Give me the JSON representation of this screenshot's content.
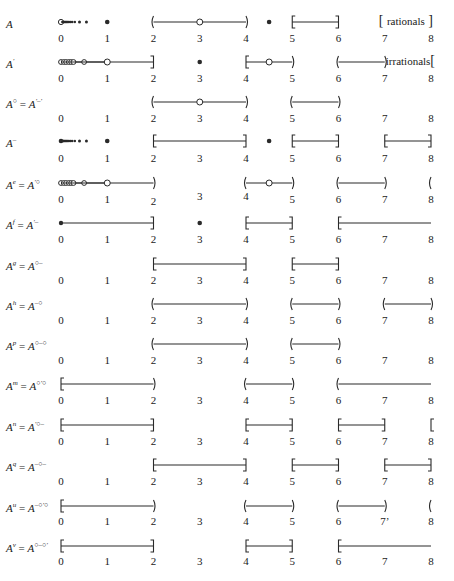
{
  "diagram": {
    "axis": {
      "min": 0,
      "max": 8,
      "x0_px": 61,
      "unit_px": 46.25,
      "ticks": [
        "0",
        "1",
        "2",
        "3",
        "4",
        "5",
        "6",
        "7",
        "8"
      ]
    },
    "rows": [
      {
        "label_base": "A",
        "label_sup": "",
        "label_rhs_base": "",
        "label_rhs_sup": "",
        "y": 22,
        "tick_y": 38,
        "tick_offsets": [
          0,
          0,
          0,
          0,
          0,
          0,
          0,
          0,
          0
        ],
        "items": [
          {
            "type": "seq_open_then_solid",
            "from": 0,
            "to": 0.9
          },
          {
            "type": "dot_solid",
            "at": 1
          },
          {
            "type": "interval",
            "from": 2,
            "to": 4,
            "left": "(",
            "right": ")"
          },
          {
            "type": "dot_open",
            "at": 3
          },
          {
            "type": "dot_solid",
            "at": 4.5
          },
          {
            "type": "interval",
            "from": 5,
            "to": 6,
            "left": "[",
            "right": "]"
          }
        ],
        "annotation": {
          "text": "rationals",
          "left_bracket": "[",
          "right_bracket": "]",
          "from": 7,
          "to": 8
        }
      },
      {
        "label_base": "A",
        "label_sup": "′",
        "label_rhs_base": "",
        "label_rhs_sup": "",
        "y": 62,
        "tick_y": 78,
        "items": [
          {
            "type": "seq_open_line",
            "from": 0,
            "to": 1
          },
          {
            "type": "interval",
            "from": 0,
            "to": 2,
            "left": "none",
            "right": "]"
          },
          {
            "type": "dot_open",
            "at": 1
          },
          {
            "type": "dot_solid",
            "at": 3
          },
          {
            "type": "interval",
            "from": 4,
            "to": 5,
            "left": "[",
            "right": ")"
          },
          {
            "type": "dot_open",
            "at": 4.5
          },
          {
            "type": "interval",
            "from": 6,
            "to": 7,
            "left": "(",
            "right": ")"
          }
        ],
        "annotation": {
          "text": "irrationals",
          "left_bracket": "",
          "right_bracket": "[",
          "from": 7,
          "to": 8
        }
      },
      {
        "label_base": "A",
        "label_sup": "○",
        "label_rhs_base": "A",
        "label_rhs_sup": "′–′",
        "y": 102,
        "tick_y": 118,
        "items": [
          {
            "type": "interval",
            "from": 2,
            "to": 4,
            "left": "(",
            "right": ")"
          },
          {
            "type": "dot_open",
            "at": 3
          },
          {
            "type": "interval",
            "from": 5,
            "to": 6,
            "left": "(",
            "right": ")"
          }
        ]
      },
      {
        "label_base": "A",
        "label_sup": "–",
        "label_rhs_base": "",
        "label_rhs_sup": "",
        "y": 141,
        "tick_y": 158,
        "items": [
          {
            "type": "seq_solid",
            "from": 0,
            "to": 0.9
          },
          {
            "type": "dot_solid",
            "at": 1
          },
          {
            "type": "interval",
            "from": 2,
            "to": 4,
            "left": "[",
            "right": "]"
          },
          {
            "type": "dot_solid",
            "at": 4.5
          },
          {
            "type": "interval",
            "from": 5,
            "to": 6,
            "left": "[",
            "right": "]"
          },
          {
            "type": "interval",
            "from": 7,
            "to": 8,
            "left": "[",
            "right": "]"
          }
        ]
      },
      {
        "label_base": "A",
        "label_sup": "e",
        "label_rhs_base": "A",
        "label_rhs_sup": "′○",
        "y": 183,
        "tick_y": 199,
        "items": [
          {
            "type": "seq_open_line",
            "from": 0,
            "to": 1
          },
          {
            "type": "interval",
            "from": 0,
            "to": 2,
            "left": "none",
            "right": ")"
          },
          {
            "type": "dot_open",
            "at": 1
          },
          {
            "type": "interval",
            "from": 4,
            "to": 5,
            "left": "(",
            "right": ")"
          },
          {
            "type": "dot_open",
            "at": 4.5
          },
          {
            "type": "interval",
            "from": 6,
            "to": 7,
            "left": "(",
            "right": ")"
          },
          {
            "type": "bracket_only",
            "at": 8,
            "side": "("
          }
        ]
      },
      {
        "label_base": "A",
        "label_sup": "f",
        "label_rhs_base": "A",
        "label_rhs_sup": "′–",
        "y": 223,
        "tick_y": 239,
        "items": [
          {
            "type": "interval",
            "from": 0,
            "to": 2,
            "left": "dot",
            "right": "]"
          },
          {
            "type": "dot_solid",
            "at": 3
          },
          {
            "type": "interval",
            "from": 4,
            "to": 5,
            "left": "[",
            "right": "]"
          },
          {
            "type": "interval",
            "from": 6,
            "to": 8,
            "left": "[",
            "right": "none"
          }
        ]
      },
      {
        "label_base": "A",
        "label_sup": "g",
        "label_rhs_base": "A",
        "label_rhs_sup": "○–",
        "y": 264,
        "tick_y": 280,
        "items": [
          {
            "type": "interval",
            "from": 2,
            "to": 4,
            "left": "[",
            "right": "]"
          },
          {
            "type": "interval",
            "from": 5,
            "to": 6,
            "left": "[",
            "right": "]"
          }
        ]
      },
      {
        "label_base": "A",
        "label_sup": "h",
        "label_rhs_base": "A",
        "label_rhs_sup": "–○",
        "y": 304,
        "tick_y": 320,
        "items": [
          {
            "type": "interval",
            "from": 2,
            "to": 4,
            "left": "(",
            "right": ")"
          },
          {
            "type": "interval",
            "from": 5,
            "to": 6,
            "left": "(",
            "right": ")"
          },
          {
            "type": "interval",
            "from": 7,
            "to": 8,
            "left": "(",
            "right": ")"
          }
        ]
      },
      {
        "label_base": "A",
        "label_sup": "p",
        "label_rhs_base": "A",
        "label_rhs_sup": "○–○",
        "y": 344,
        "tick_y": 360,
        "items": [
          {
            "type": "interval",
            "from": 2,
            "to": 4,
            "left": "(",
            "right": ")"
          },
          {
            "type": "interval",
            "from": 5,
            "to": 6,
            "left": "(",
            "right": ")"
          }
        ]
      },
      {
        "label_base": "A",
        "label_sup": "m",
        "label_rhs_base": "A",
        "label_rhs_sup": "○′○",
        "y": 384,
        "tick_y": 400,
        "items": [
          {
            "type": "interval",
            "from": 0,
            "to": 2,
            "left": "[",
            "right": ")"
          },
          {
            "type": "interval",
            "from": 4,
            "to": 5,
            "left": "(",
            "right": ")"
          },
          {
            "type": "interval",
            "from": 6,
            "to": 8,
            "left": "(",
            "right": "none"
          }
        ]
      },
      {
        "label_base": "A",
        "label_sup": "n",
        "label_rhs_base": "A",
        "label_rhs_sup": "′○–",
        "y": 425,
        "tick_y": 441,
        "items": [
          {
            "type": "interval",
            "from": 0,
            "to": 2,
            "left": "[",
            "right": "]"
          },
          {
            "type": "interval",
            "from": 4,
            "to": 5,
            "left": "[",
            "right": "]"
          },
          {
            "type": "interval",
            "from": 6,
            "to": 7,
            "left": "[",
            "right": "]"
          },
          {
            "type": "bracket_only",
            "at": 8,
            "side": "["
          }
        ]
      },
      {
        "label_base": "A",
        "label_sup": "q",
        "label_rhs_base": "A",
        "label_rhs_sup": "–○–",
        "y": 465,
        "tick_y": 481,
        "items": [
          {
            "type": "interval",
            "from": 2,
            "to": 4,
            "left": "[",
            "right": "]"
          },
          {
            "type": "interval",
            "from": 5,
            "to": 6,
            "left": "[",
            "right": "]"
          },
          {
            "type": "interval",
            "from": 7,
            "to": 8,
            "left": "[",
            "right": "]"
          }
        ]
      },
      {
        "label_base": "A",
        "label_sup": "u",
        "label_rhs_base": "A",
        "label_rhs_sup": "–○′○",
        "y": 506,
        "tick_y": 521,
        "items": [
          {
            "type": "interval",
            "from": 0,
            "to": 2,
            "left": "[",
            "right": ")"
          },
          {
            "type": "interval",
            "from": 4,
            "to": 5,
            "left": "(",
            "right": ")"
          },
          {
            "type": "interval",
            "from": 6,
            "to": 7,
            "left": "(",
            "right": ")"
          },
          {
            "type": "bracket_only",
            "at": 8,
            "side": "("
          }
        ],
        "tick_suffix": {
          "index": 7,
          "text": "7’"
        }
      },
      {
        "label_base": "A",
        "label_sup": "v",
        "label_rhs_base": "A",
        "label_rhs_sup": "○–○′",
        "y": 546,
        "tick_y": 561,
        "items": [
          {
            "type": "interval",
            "from": 0,
            "to": 2,
            "left": "[",
            "right": "]"
          },
          {
            "type": "interval",
            "from": 4,
            "to": 5,
            "left": "[",
            "right": "]"
          },
          {
            "type": "interval",
            "from": 6,
            "to": 8,
            "left": "[",
            "right": "none"
          }
        ]
      }
    ],
    "row_tick_y_offsets_px": [
      0,
      0,
      0,
      0,
      [
        0,
        0,
        2,
        -3,
        -3,
        0,
        0,
        0,
        0
      ],
      0,
      0,
      0,
      0,
      0,
      0,
      0,
      0,
      0
    ]
  }
}
